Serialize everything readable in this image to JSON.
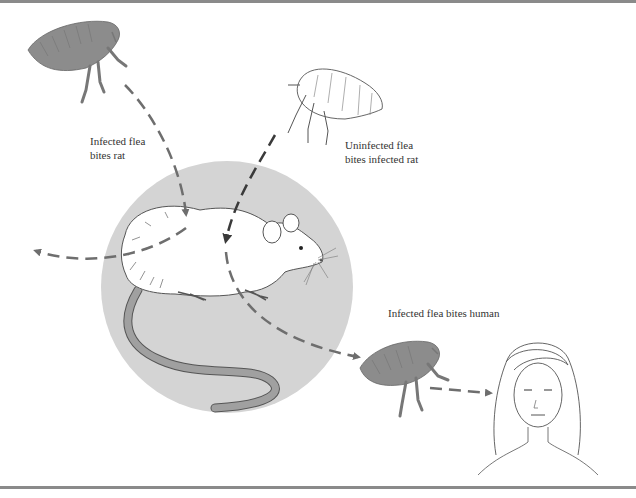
{
  "diagram": {
    "labels": {
      "infected_flea_bites_rat": [
        "Infected flea",
        "bites rat"
      ],
      "uninfected_flea_bites_infected_rat": [
        "Uninfected flea",
        "bites infected rat"
      ],
      "infected_flea_bites_human": "Infected flea bites human"
    },
    "colors": {
      "circle_fill": "#d4d4d4",
      "infected_flea": "#8c8c8c",
      "uninfected_flea": "#ffffff",
      "arrow": "#6e6e6e",
      "rule": "#8a8a8a",
      "text": "#333333",
      "tail": "#9a9a9a"
    },
    "nodes": [
      {
        "id": "infected-flea-top",
        "kind": "infected flea",
        "pos": [
          80,
          75
        ]
      },
      {
        "id": "uninfected-flea",
        "kind": "uninfected flea",
        "pos": [
          330,
          115
        ]
      },
      {
        "id": "rat",
        "kind": "rat",
        "pos": [
          227,
          287
        ]
      },
      {
        "id": "infected-flea-bottom",
        "kind": "infected flea",
        "pos": [
          400,
          375
        ]
      },
      {
        "id": "human",
        "kind": "human",
        "pos": [
          535,
          400
        ]
      }
    ],
    "edges": [
      {
        "from": "infected-flea-top",
        "to": "rat",
        "style": "dashed-arrow"
      },
      {
        "from": "uninfected-flea",
        "to": "rat",
        "style": "dashed-arrow"
      },
      {
        "from": "rat",
        "to": "offscreen-left",
        "style": "dashed-arrow"
      },
      {
        "from": "rat",
        "to": "infected-flea-bottom",
        "style": "dashed-arrow"
      },
      {
        "from": "infected-flea-bottom",
        "to": "human",
        "style": "dashed-arrow"
      }
    ]
  }
}
